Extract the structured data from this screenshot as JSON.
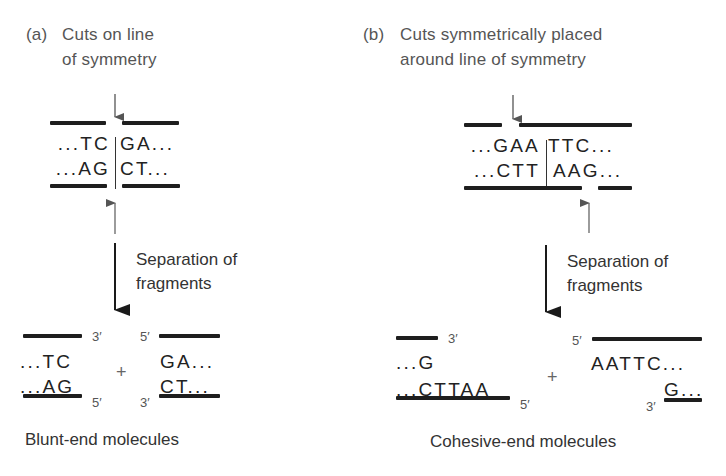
{
  "panel_a": {
    "letter": "(a)",
    "title_line1": "Cuts on line",
    "title_line2": "of symmetry",
    "top_strand": {
      "left": "...TC",
      "right": "GA..."
    },
    "bottom_strand": {
      "left": "...AG",
      "right": "CT..."
    },
    "separation_line1": "Separation of",
    "separation_line2": "fragments",
    "fragment_left": {
      "top": "...TC",
      "bottom": "...AG",
      "top_end": "3′",
      "bottom_end": "5′"
    },
    "plus": "+",
    "fragment_right": {
      "top": "GA...",
      "bottom": "CT...",
      "top_end": "5′",
      "bottom_end": "3′"
    },
    "result_label": "Blunt-end molecules"
  },
  "panel_b": {
    "letter": "(b)",
    "title_line1": "Cuts symmetrically placed",
    "title_line2": "around line of symmetry",
    "top_strand": {
      "left": "...GAA",
      "right": "TTC..."
    },
    "bottom_strand": {
      "left": "...CTT",
      "right": "AAG..."
    },
    "separation_line1": "Separation of",
    "separation_line2": "fragments",
    "fragment_left": {
      "top": "...G",
      "bottom": "...CTTAA",
      "top_end": "3′",
      "bottom_end": "5′"
    },
    "plus": "+",
    "fragment_right": {
      "top": "AATTC...",
      "bottom": "G...",
      "top_end": "5′",
      "bottom_end": "3′"
    },
    "result_label": "Cohesive-end molecules"
  },
  "colors": {
    "strand": "#1e1e1e",
    "text": "#2a2a2a",
    "caption": "#555555",
    "arrow_cut": "#555555"
  }
}
